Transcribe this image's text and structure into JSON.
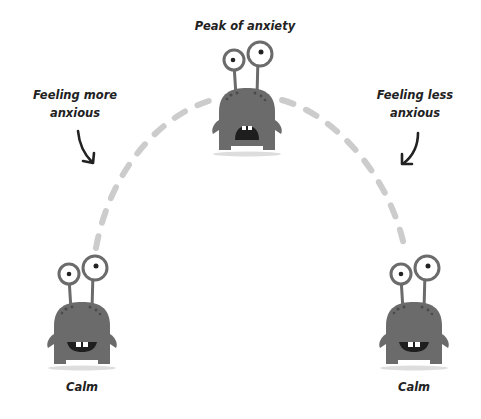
{
  "labels": {
    "peak": "Peak of anxiety",
    "rising_line1": "Feeling more",
    "rising_line2": "anxious",
    "falling_line1": "Feeling less",
    "falling_line2": "anxious",
    "calm_left": "Calm",
    "calm_right": "Calm"
  },
  "colors": {
    "monster_body": "#6b6b6b",
    "monster_spots": "#4a4a4a",
    "arc": "#cccccc",
    "text": "#222222",
    "shadow": "#dddddd"
  },
  "icons": {
    "monster_peak": "anxious-monster-icon",
    "monster_calm_left": "calm-monster-icon",
    "monster_calm_right": "calm-monster-icon",
    "arrow_left": "curved-arrow-down-icon",
    "arrow_right": "curved-arrow-down-icon"
  }
}
